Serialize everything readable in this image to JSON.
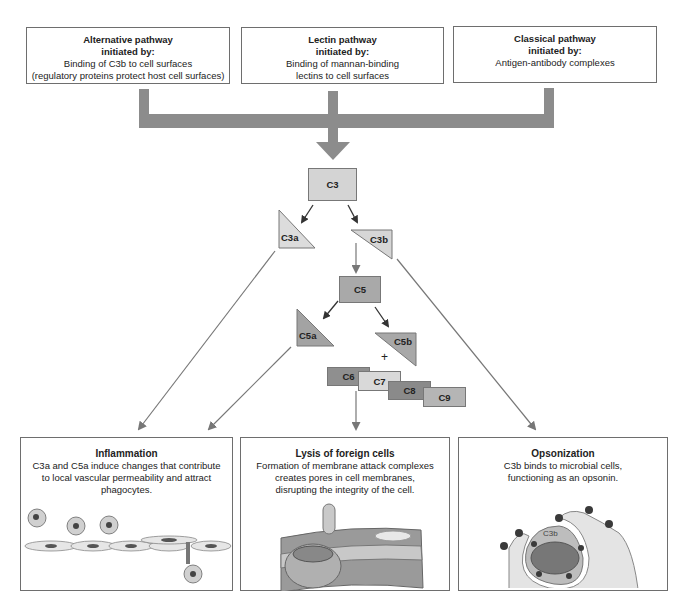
{
  "pathways": [
    {
      "title": "Alternative pathway",
      "subtitle": "initiated by:",
      "desc_lines": [
        "Binding of C3b to cell surfaces",
        "(regulatory proteins protect host cell surfaces)"
      ]
    },
    {
      "title": "Lectin pathway",
      "subtitle": "initiated by:",
      "desc_lines": [
        "Binding of mannan-binding",
        "lectins to cell surfaces"
      ]
    },
    {
      "title": "Classical pathway",
      "subtitle": "initiated by:",
      "desc_lines": [
        "Antigen-antibody complexes"
      ]
    }
  ],
  "cascade": {
    "c3": "C3",
    "c3a": "C3a",
    "c3b": "C3b",
    "c5": "C5",
    "c5a": "C5a",
    "c5b": "C5b",
    "plus": "+",
    "c6": "C6",
    "c7": "C7",
    "c8": "C8",
    "c9": "C9"
  },
  "outcomes": [
    {
      "title": "Inflammation",
      "desc_lines": [
        "C3a and C5a induce changes that contribute",
        "to local vascular permeability and attract",
        "phagocytes."
      ]
    },
    {
      "title": "Lysis of foreign cells",
      "desc_lines": [
        "Formation of membrane attack complexes",
        "creates pores in cell membranes,",
        "disrupting the integrity of the cell."
      ]
    },
    {
      "title": "Opsonization",
      "desc_lines": [
        "C3b binds to microbial cells,",
        "functioning as an opsonin."
      ],
      "illustration_label": "C3b"
    }
  ],
  "colors": {
    "connector": "#8c8c8c",
    "c3": "#d4d4d4",
    "c3a": "#dcdcdc",
    "c3b": "#d6d6d6",
    "c5": "#a9a9a9",
    "c5a": "#a3a3a3",
    "c5b": "#a8a8a8",
    "c6": "#8f8f8f",
    "c7": "#d9d9d9",
    "c8": "#8a8a8a",
    "c9": "#b5b5b5"
  }
}
